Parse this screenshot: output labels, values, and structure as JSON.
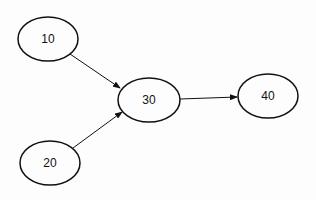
{
  "diagram": {
    "nodes": [
      {
        "id": "n10",
        "label": "10",
        "cx": 48,
        "cy": 39,
        "rx": 30,
        "ry": 22
      },
      {
        "id": "n20",
        "label": "20",
        "cx": 50,
        "cy": 163,
        "rx": 30,
        "ry": 22
      },
      {
        "id": "n30",
        "label": "30",
        "cx": 149,
        "cy": 100,
        "rx": 31,
        "ry": 22
      },
      {
        "id": "n40",
        "label": "40",
        "cx": 268,
        "cy": 96,
        "rx": 30,
        "ry": 22
      }
    ],
    "edges": [
      {
        "from": "10",
        "to": "30"
      },
      {
        "from": "20",
        "to": "30"
      },
      {
        "from": "30",
        "to": "40"
      }
    ],
    "colors": {
      "stroke": "#111111",
      "background": "#fdfdfd"
    }
  }
}
